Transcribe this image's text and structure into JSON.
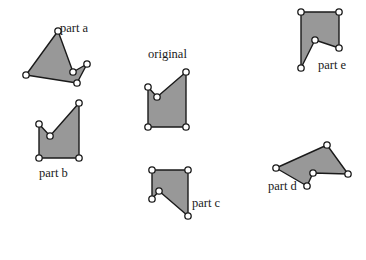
{
  "figure": {
    "background_color": "#ffffff",
    "shape_fill_color": "#989898",
    "shape_stroke_color": "#1a1a1a",
    "vertex_fill_color": "#ffffff",
    "width": 366,
    "height": 260
  },
  "shapes": [
    {
      "id": "original",
      "label": "original",
      "label_x": 148,
      "label_y": 48,
      "points": "148,87 157,97 186,72 186,127 148,127",
      "vertices": [
        {
          "x": 148,
          "y": 87
        },
        {
          "x": 157,
          "y": 97
        },
        {
          "x": 186,
          "y": 72
        },
        {
          "x": 186,
          "y": 127
        },
        {
          "x": 148,
          "y": 127
        }
      ]
    },
    {
      "id": "part-a",
      "label": "part a",
      "label_x": 60,
      "label_y": 22,
      "points": "58,31 73,72 87,64 77,83 26,75",
      "vertices": [
        {
          "x": 58,
          "y": 31
        },
        {
          "x": 73,
          "y": 72
        },
        {
          "x": 87,
          "y": 64
        },
        {
          "x": 77,
          "y": 83
        },
        {
          "x": 26,
          "y": 75
        }
      ]
    },
    {
      "id": "part-b",
      "label": "part b",
      "label_x": 39,
      "label_y": 167,
      "points": "39,124 50,136 79,103 79,158 39,158",
      "vertices": [
        {
          "x": 39,
          "y": 124
        },
        {
          "x": 50,
          "y": 136
        },
        {
          "x": 79,
          "y": 103
        },
        {
          "x": 79,
          "y": 158
        },
        {
          "x": 39,
          "y": 158
        }
      ]
    },
    {
      "id": "part-c",
      "label": "part c",
      "label_x": 192,
      "label_y": 197,
      "points": "152,170 188,170 188,216 159,191 152,199",
      "vertices": [
        {
          "x": 152,
          "y": 170
        },
        {
          "x": 188,
          "y": 170
        },
        {
          "x": 188,
          "y": 216
        },
        {
          "x": 159,
          "y": 191
        },
        {
          "x": 152,
          "y": 199
        }
      ]
    },
    {
      "id": "part-d",
      "label": "part d",
      "label_x": 268,
      "label_y": 180,
      "points": "276,168 327,145 348,174 313,173 307,186",
      "vertices": [
        {
          "x": 276,
          "y": 168
        },
        {
          "x": 327,
          "y": 145
        },
        {
          "x": 348,
          "y": 174
        },
        {
          "x": 313,
          "y": 173
        },
        {
          "x": 307,
          "y": 186
        }
      ]
    },
    {
      "id": "part-e",
      "label": "part e",
      "label_x": 318,
      "label_y": 59,
      "points": "301,12 339,12 339,48 315,40 301,68",
      "vertices": [
        {
          "x": 301,
          "y": 12
        },
        {
          "x": 339,
          "y": 12
        },
        {
          "x": 339,
          "y": 48
        },
        {
          "x": 315,
          "y": 40
        },
        {
          "x": 301,
          "y": 68
        }
      ]
    }
  ]
}
